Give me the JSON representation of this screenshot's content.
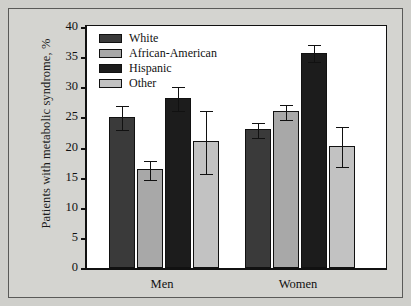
{
  "chart_data": {
    "type": "bar",
    "title": "",
    "xlabel": "",
    "ylabel": "Patients with metabolic syndrome, %",
    "ylim": [
      0,
      40
    ],
    "yticks": [
      0,
      5,
      10,
      15,
      20,
      25,
      30,
      35,
      40
    ],
    "ytick_labels": [
      "0",
      "5",
      "10",
      "15",
      "20",
      "25",
      "30",
      "35",
      "40"
    ],
    "grid": false,
    "legend_position": "top-left",
    "categories": [
      "Men",
      "Women"
    ],
    "series": [
      {
        "name": "White",
        "color": "#3a3a3a",
        "values": [
          25.0,
          23.0
        ],
        "errors": [
          2.0,
          1.2
        ]
      },
      {
        "name": "African-American",
        "color": "#a8a8a8",
        "values": [
          16.4,
          26.0
        ],
        "errors": [
          1.6,
          1.3
        ]
      },
      {
        "name": "Hispanic",
        "color": "#1c1c1c",
        "values": [
          28.2,
          35.7
        ],
        "errors": [
          2.0,
          1.4
        ]
      },
      {
        "name": "Other",
        "color": "#c2c2c2",
        "values": [
          21.0,
          20.3
        ],
        "errors": [
          5.2,
          3.3
        ]
      }
    ]
  },
  "legend": {
    "items": [
      {
        "label": "White",
        "color": "#3a3a3a"
      },
      {
        "label": "African-American",
        "color": "#a8a8a8"
      },
      {
        "label": "Hispanic",
        "color": "#1c1c1c"
      },
      {
        "label": "Other",
        "color": "#c2c2c2"
      }
    ]
  }
}
